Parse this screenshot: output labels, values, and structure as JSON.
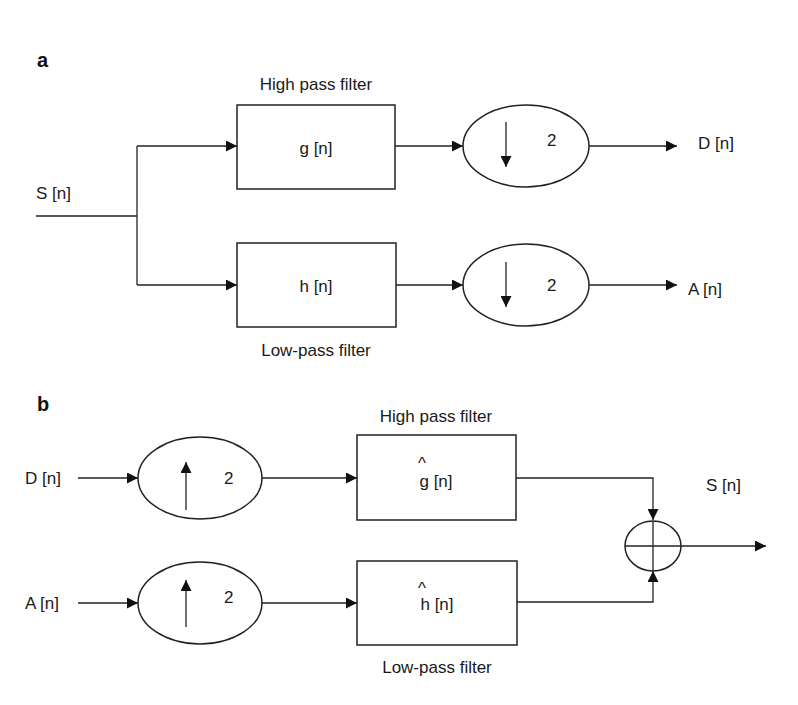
{
  "figure": {
    "panel_a": {
      "label": "a",
      "input_label": "S [n]",
      "high_pass": {
        "caption": "High pass filter",
        "block": "g [n]"
      },
      "low_pass": {
        "caption": "Low-pass filter",
        "block": "h [n]"
      },
      "downsampler_top": {
        "factor": "2",
        "direction": "down"
      },
      "downsampler_bottom": {
        "factor": "2",
        "direction": "down"
      },
      "output_top": "D [n]",
      "output_bottom": "A [n]"
    },
    "panel_b": {
      "label": "b",
      "input_top": "D [n]",
      "input_bottom": "A [n]",
      "upsampler_top": {
        "factor": "2",
        "direction": "up"
      },
      "upsampler_bottom": {
        "factor": "2",
        "direction": "up"
      },
      "high_pass": {
        "caption": "High pass filter",
        "block_symbol": "g",
        "block_suffix": " [n]",
        "hat": "^"
      },
      "low_pass": {
        "caption": "Low-pass filter",
        "block_symbol": "h",
        "block_suffix": " [n]",
        "hat": "^"
      },
      "summer": "adder",
      "output_label": "S [n]"
    }
  }
}
